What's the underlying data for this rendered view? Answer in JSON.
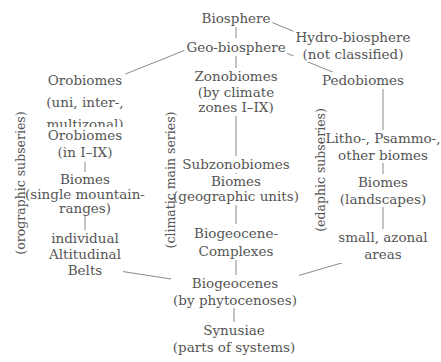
{
  "diagram": {
    "colors": {
      "text": "#555555",
      "line": "#7a7a7a",
      "background": "#ffffff"
    },
    "nodes": {
      "biosphere": {
        "lines": [
          "Biosphere"
        ]
      },
      "hydro": {
        "lines": [
          "Hydro-biosphere",
          "(not classified)"
        ]
      },
      "geo": {
        "lines": [
          "Geo-biosphere"
        ]
      },
      "orobiomes_zonal": {
        "lines": [
          "Orobiomes",
          "(uni, inter-,",
          "multizonal)"
        ]
      },
      "zonobiomes": {
        "lines": [
          "Zonobiomes",
          "(by climate",
          "zones I–IX)"
        ]
      },
      "pedobiomes": {
        "lines": [
          "Pedobiomes"
        ]
      },
      "orobiomes_in": {
        "lines": [
          "Orobiomes",
          "(in I–IX)"
        ]
      },
      "subzonobiomes": {
        "lines": [
          "Subzonobiomes"
        ]
      },
      "litho": {
        "lines": [
          "Litho-, Psammo-,",
          "other biomes"
        ]
      },
      "biomes_mountain": {
        "lines": [
          "Biomes",
          "(single mountain-",
          "ranges)"
        ]
      },
      "biomes_geo": {
        "lines": [
          "Biomes",
          "(geographic units)"
        ]
      },
      "biomes_land": {
        "lines": [
          "Biomes",
          "(landscapes)"
        ]
      },
      "altitudinal": {
        "lines": [
          "individual",
          "Altitudinal",
          "Belts"
        ]
      },
      "complexes": {
        "lines": [
          "Biogeocene-",
          "Complexes"
        ]
      },
      "azonal": {
        "lines": [
          "small, azonal",
          "areas"
        ]
      },
      "biogeocenes": {
        "lines": [
          "Biogeocenes",
          "(by phytocenoses)"
        ]
      },
      "synusiae": {
        "lines": [
          "Synusiae",
          "(parts of systems)"
        ]
      }
    },
    "series_labels": {
      "orographic": "(orographic subseries)",
      "climatic": "(climatic main series)",
      "edaphic": "(edaphic subseries)"
    },
    "edges": [
      [
        "biosphere",
        "geo"
      ],
      [
        "biosphere",
        "hydro"
      ],
      [
        "geo",
        "orobiomes_zonal"
      ],
      [
        "geo",
        "zonobiomes"
      ],
      [
        "geo",
        "pedobiomes"
      ],
      [
        "orobiomes_zonal",
        "orobiomes_in"
      ],
      [
        "orobiomes_in",
        "biomes_mountain"
      ],
      [
        "biomes_mountain",
        "altitudinal"
      ],
      [
        "zonobiomes",
        "subzonobiomes"
      ],
      [
        "subzonobiomes",
        "biomes_geo"
      ],
      [
        "biomes_geo",
        "complexes"
      ],
      [
        "pedobiomes",
        "litho"
      ],
      [
        "litho",
        "biomes_land"
      ],
      [
        "biomes_land",
        "azonal"
      ],
      [
        "complexes",
        "biogeocenes"
      ],
      [
        "altitudinal",
        "biogeocenes"
      ],
      [
        "azonal",
        "biogeocenes"
      ],
      [
        "biogeocenes",
        "synusiae"
      ]
    ]
  }
}
